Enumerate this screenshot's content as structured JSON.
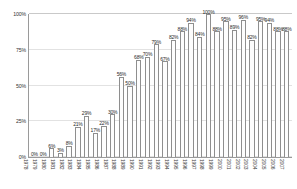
{
  "chart_data": {
    "type": "bar",
    "title": "",
    "subtitle": "",
    "xlabel": "",
    "ylabel": "",
    "ylim": [
      0,
      100
    ],
    "grid": true,
    "legend": false,
    "legend_position": "none",
    "y_ticks": [
      "0%",
      "25%",
      "50%",
      "75%",
      "100%"
    ],
    "y_tick_values": [
      0,
      25,
      50,
      75,
      100
    ],
    "categories": [
      "1978",
      "1979",
      "1980",
      "1981",
      "1982",
      "1983",
      "1984",
      "1985",
      "1986",
      "1987",
      "1988",
      "1989",
      "1990",
      "1991",
      "1992",
      "1993",
      "1994",
      "1995",
      "1996",
      "1997",
      "1998",
      "1999",
      "2000",
      "2001",
      "2002",
      "2003",
      "2004",
      "2005",
      "2006",
      "2007"
    ],
    "values": [
      0,
      0,
      6,
      3,
      8,
      21,
      29,
      17,
      22,
      30,
      56,
      50,
      68,
      70,
      79,
      67,
      82,
      88,
      94,
      84,
      100,
      88,
      95,
      89,
      96,
      82,
      95,
      94,
      88,
      88
    ],
    "data_labels": [
      "0%",
      "0%",
      "6%",
      "3%",
      "8%",
      "21%",
      "29%",
      "17%",
      "22%",
      "30%",
      "56%",
      "50%",
      "68%",
      "70%",
      "79%",
      "67%",
      "82%",
      "88%",
      "94%",
      "84%",
      "100%",
      "88%",
      "95%",
      "89%",
      "96%",
      "82%",
      "95%",
      "94%",
      "88%",
      "88%"
    ],
    "colors": {
      "bar_fill": "#fdfdfd",
      "bar_stroke": "#8e8e8e",
      "axis": "#9a9a9a",
      "grid": "#e2e2e2",
      "text": "#2b2b2b"
    }
  }
}
